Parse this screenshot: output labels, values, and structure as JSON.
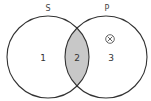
{
  "diagram": {
    "type": "venn",
    "sets": [
      {
        "name": "S",
        "cx": 48,
        "cy": 57,
        "r": 41
      },
      {
        "name": "P",
        "cx": 106,
        "cy": 57,
        "r": 41
      }
    ],
    "regions": [
      {
        "label": "1",
        "description": "S only",
        "shaded": false
      },
      {
        "label": "2",
        "description": "S and P",
        "shaded": true
      },
      {
        "label": "3",
        "description": "P only",
        "shaded": false
      }
    ],
    "marker": {
      "symbol": "⊗",
      "region": "3",
      "description": "circled X marking existence in P only"
    },
    "colors": {
      "stroke": "#333333",
      "shade": "#c8c8c8",
      "background": "#ffffff"
    }
  }
}
